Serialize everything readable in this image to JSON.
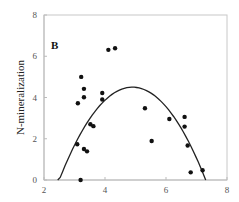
{
  "chart_data": {
    "type": "scatter",
    "title": "",
    "panel_label": "B",
    "xlabel": "",
    "ylabel": "N-mineralization",
    "xlim": [
      2,
      8
    ],
    "ylim": [
      0,
      8
    ],
    "xticks": [
      2,
      4,
      6,
      8
    ],
    "yticks": [
      0,
      2,
      4,
      6,
      8
    ],
    "grid": false,
    "legend": null,
    "series": [
      {
        "name": "observations",
        "kind": "scatter",
        "color": "#111111",
        "points": [
          {
            "x": 3.22,
            "y": 5.0
          },
          {
            "x": 3.31,
            "y": 4.42
          },
          {
            "x": 3.31,
            "y": 4.01
          },
          {
            "x": 3.11,
            "y": 3.72
          },
          {
            "x": 3.91,
            "y": 4.22
          },
          {
            "x": 3.91,
            "y": 3.9
          },
          {
            "x": 4.11,
            "y": 6.31
          },
          {
            "x": 4.33,
            "y": 6.39
          },
          {
            "x": 3.52,
            "y": 2.7
          },
          {
            "x": 3.62,
            "y": 2.61
          },
          {
            "x": 3.09,
            "y": 1.73
          },
          {
            "x": 3.31,
            "y": 1.5
          },
          {
            "x": 3.41,
            "y": 1.39
          },
          {
            "x": 3.2,
            "y": 0.0
          },
          {
            "x": 5.31,
            "y": 3.48
          },
          {
            "x": 5.53,
            "y": 1.89
          },
          {
            "x": 6.11,
            "y": 2.96
          },
          {
            "x": 6.61,
            "y": 3.06
          },
          {
            "x": 6.61,
            "y": 2.59
          },
          {
            "x": 6.71,
            "y": 1.67
          },
          {
            "x": 6.81,
            "y": 0.37
          },
          {
            "x": 7.2,
            "y": 0.47
          }
        ]
      },
      {
        "name": "quadratic fit",
        "kind": "line",
        "color": "#222222",
        "equation": "y = 4.5 - 0.78*(x - 4.9)^2",
        "x_range": [
          2.45,
          7.3
        ],
        "vertex": {
          "x": 4.9,
          "y": 4.5
        }
      }
    ]
  }
}
